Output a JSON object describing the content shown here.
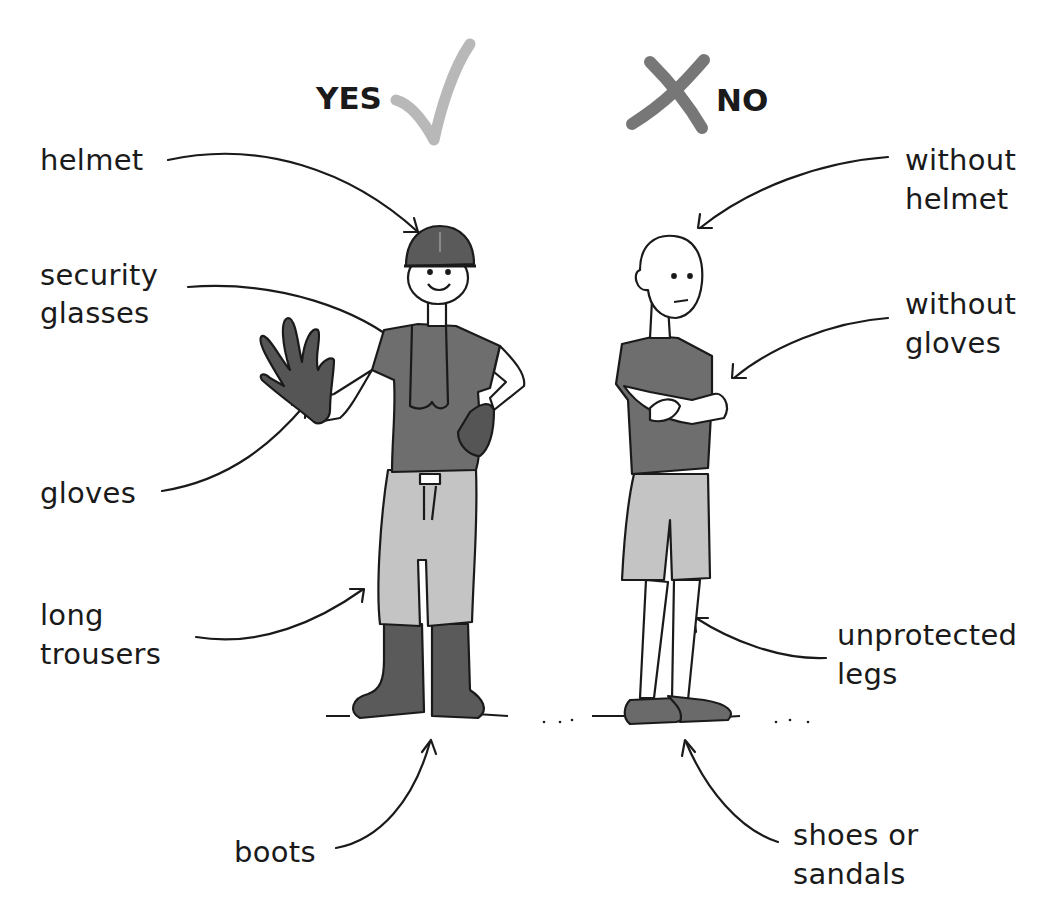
{
  "header": {
    "yes_label": "YES",
    "no_label": "NO",
    "yes_icon": "checkmark-icon",
    "no_icon": "cross-icon",
    "yes_color": "#b8b8b8",
    "no_color": "#777777"
  },
  "left_figure": {
    "description": "worker with protective equipment",
    "labels": {
      "helmet": "helmet",
      "glasses_1": "security",
      "glasses_2": "glasses",
      "gloves": "gloves",
      "trousers_1": "long",
      "trousers_2": "trousers",
      "boots": "boots"
    }
  },
  "right_figure": {
    "description": "worker without protective equipment",
    "labels": {
      "helmet_1": "without",
      "helmet_2": "helmet",
      "gloves_1": "without",
      "gloves_2": "gloves",
      "legs_1": "unprotected",
      "legs_2": "legs",
      "shoes_1": "shoes or",
      "shoes_2": "sandals"
    }
  },
  "colors": {
    "shirt": "#6e6e6e",
    "trousers": "#c4c4c4",
    "boots": "#5a5a5a",
    "outline": "#1a1a1a"
  }
}
